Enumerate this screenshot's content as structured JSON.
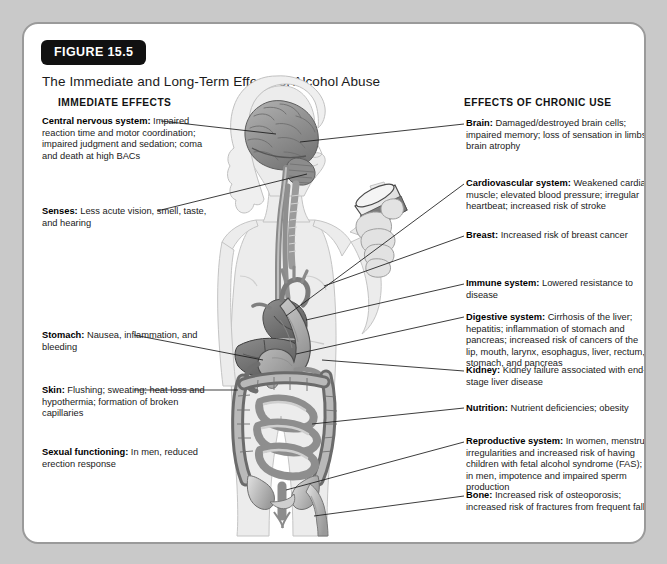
{
  "figure": {
    "badge": "FIGURE 15.5",
    "title": "The Immediate and Long-Term Effects of Alcohol Abuse",
    "columns": {
      "left_heading": "IMMEDIATE EFFECTS",
      "right_heading": "EFFECTS OF CHRONIC USE"
    }
  },
  "immediate_effects": [
    {
      "term": "Central nervous system:",
      "text": " Impaired reaction time and motor coordination; impaired judgment and sedation; coma and death at high BACs"
    },
    {
      "term": "Senses:",
      "text": " Less acute vision, smell, taste, and hearing"
    },
    {
      "term": "Stomach:",
      "text": " Nausea, inflammation, and bleeding"
    },
    {
      "term": "Skin:",
      "text": " Flushing; sweating; heat loss and hypothermia; formation of broken capillaries"
    },
    {
      "term": "Sexual functioning:",
      "text": " In men, reduced erection response"
    }
  ],
  "chronic_effects": [
    {
      "term": "Brain:",
      "text": " Damaged/destroyed brain cells; impaired memory; loss of sensation in limbs; brain atrophy"
    },
    {
      "term": "Cardiovascular system:",
      "text": " Weakened cardiac muscle; elevated blood pressure; irregular heartbeat; increased risk of stroke"
    },
    {
      "term": "Breast:",
      "text": " Increased risk of breast cancer"
    },
    {
      "term": "Immune system:",
      "text": " Lowered resistance to disease"
    },
    {
      "term": "Digestive system:",
      "text": " Cirrhosis of the liver; hepatitis; inflammation of stomach and pancreas; increased risk of cancers of the lip, mouth, larynx, esophagus, liver, rectum, stomach, and pancreas"
    },
    {
      "term": "Kidney:",
      "text": " Kidney failure associated with end-stage liver disease"
    },
    {
      "term": "Nutrition:",
      "text": " Nutrient deficiencies; obesity"
    },
    {
      "term": "Reproductive system:",
      "text": " In women, menstrual irregularities and increased risk of having children with fetal alcohol syndrome (FAS); in men, impotence and impaired sperm production"
    },
    {
      "term": "Bone:",
      "text": " Increased risk of osteoporosis; increased risk of fractures from frequent falls"
    }
  ],
  "illustration": {
    "description": "Grayscale anatomical drawing of a standing human figure in three-quarter view holding a drinking glass, with brain, spinal cord, esophagus, trachea, heart, liver, stomach, intestines, pelvis and femur visible",
    "organs": [
      "brain",
      "spinal-cord",
      "esophagus",
      "trachea",
      "heart",
      "liver",
      "stomach",
      "small-intestine",
      "large-intestine",
      "pelvis",
      "femur",
      "drinking-glass"
    ]
  },
  "colors": {
    "page_background": "#c9c9c9",
    "card_background": "#ffffff",
    "card_border": "#9a9a9a",
    "badge_background": "#111111",
    "badge_text": "#ffffff",
    "body_text": "#1a1a1a",
    "leader_line": "#1a1a1a",
    "body_silhouette": "#ededed",
    "organ_mid": "#9d9d9d",
    "organ_dark": "#6f6f6f"
  }
}
